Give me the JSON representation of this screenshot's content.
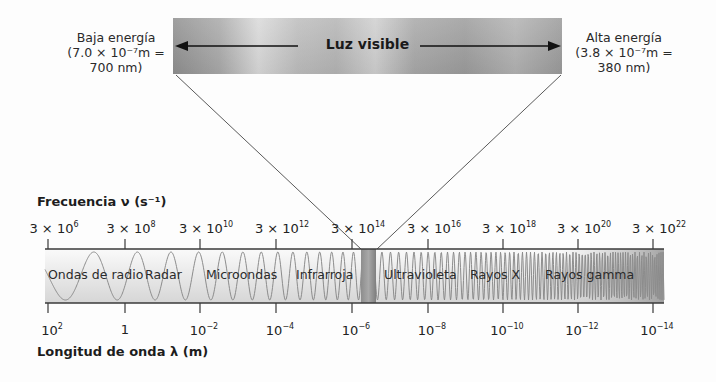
{
  "visible_light": {
    "title": "Luz visible",
    "low_energy": {
      "line1": "Baja energía",
      "line2": "(7.0 × 10⁻⁷m =",
      "line3": "700 nm)"
    },
    "high_energy": {
      "line1": "Alta energía",
      "line2": "(3.8 × 10⁻⁷m =",
      "line3": "380 nm)"
    }
  },
  "frequency_axis": {
    "title": "Frecuencia ν (s⁻¹)",
    "ticks": [
      {
        "base": "3 × 10",
        "exp": "6"
      },
      {
        "base": "3 × 10",
        "exp": "8"
      },
      {
        "base": "3 × 10",
        "exp": "10"
      },
      {
        "base": "3 × 10",
        "exp": "12"
      },
      {
        "base": "3 × 10",
        "exp": "14"
      },
      {
        "base": "3 × 10",
        "exp": "16"
      },
      {
        "base": "3 × 10",
        "exp": "18"
      },
      {
        "base": "3 × 10",
        "exp": "20"
      },
      {
        "base": "3 × 10",
        "exp": "22"
      }
    ]
  },
  "wavelength_axis": {
    "title": "Longitud de onda λ (m)",
    "ticks": [
      {
        "base": "10",
        "exp": "2"
      },
      {
        "base": "1",
        "exp": ""
      },
      {
        "base": "10",
        "exp": "−2"
      },
      {
        "base": "10",
        "exp": "−4"
      },
      {
        "base": "10",
        "exp": "−6"
      },
      {
        "base": "10",
        "exp": "−8"
      },
      {
        "base": "10",
        "exp": "−10"
      },
      {
        "base": "10",
        "exp": "−12"
      },
      {
        "base": "10",
        "exp": "−14"
      }
    ]
  },
  "regions": [
    {
      "label": "Ondas de radio"
    },
    {
      "label": "Radar"
    },
    {
      "label": "Microondas"
    },
    {
      "label": "Infrarroja"
    },
    {
      "label": "Ultravioleta"
    },
    {
      "label": "Rayos X"
    },
    {
      "label": "Rayos gamma"
    }
  ],
  "colors": {
    "axis": "#3a3a3a",
    "wave": "#8c8c8c",
    "band_light": "#f4f4f4",
    "band_dark": "#d8d8d8"
  }
}
